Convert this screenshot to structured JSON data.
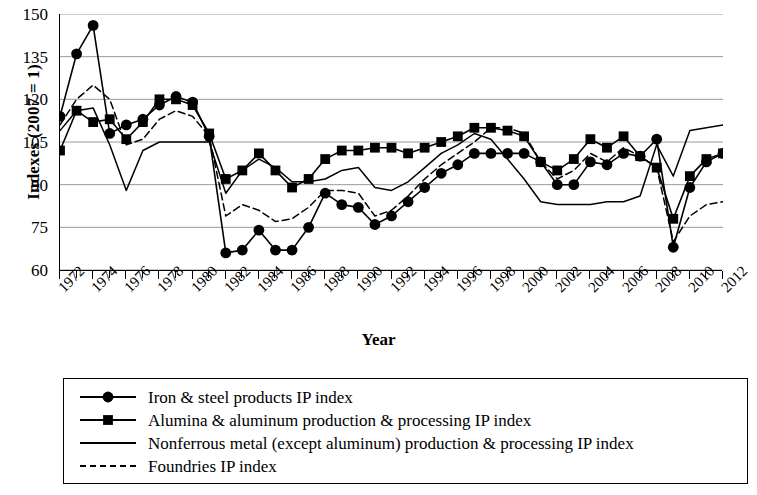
{
  "chart_data": {
    "type": "line",
    "title": "",
    "xlabel": "Year",
    "ylabel": "Indexes (2007 = 1)",
    "xlim": [
      1972,
      2012
    ],
    "ylim": [
      60,
      150
    ],
    "yticks": [
      150,
      135,
      120,
      105,
      90,
      75,
      60
    ],
    "xticks": [
      1972,
      1974,
      1976,
      1978,
      1980,
      1982,
      1984,
      1986,
      1988,
      1990,
      1992,
      1994,
      1996,
      1998,
      2000,
      2002,
      2004,
      2006,
      2008,
      2010,
      2012
    ],
    "xtick_labels": [
      "1972",
      "1974",
      "1976",
      "1978",
      "1980",
      "1982",
      "1984",
      "1986",
      "1988",
      "1990",
      "1992",
      "1994",
      "1996",
      "1998",
      "2000",
      "2002",
      "2004",
      "2006",
      "2008",
      "2010",
      "2012"
    ],
    "grid": "horizontal",
    "legend_position": "below",
    "x": [
      1972,
      1973,
      1974,
      1975,
      1976,
      1977,
      1978,
      1979,
      1980,
      1981,
      1982,
      1983,
      1984,
      1985,
      1986,
      1987,
      1988,
      1989,
      1990,
      1991,
      1992,
      1993,
      1994,
      1995,
      1996,
      1997,
      1998,
      1999,
      2000,
      2001,
      2002,
      2003,
      2004,
      2005,
      2006,
      2007,
      2008,
      2009,
      2010,
      2011,
      2012
    ],
    "series": [
      {
        "name": "Iron & steel products IP index",
        "marker": "circle",
        "line": "solid",
        "values": [
          114,
          136,
          146,
          108,
          111,
          113,
          118,
          121,
          119,
          107,
          66,
          67,
          74,
          67,
          67,
          75,
          87,
          83,
          82,
          76,
          79,
          84,
          89,
          94,
          97,
          101,
          101,
          101,
          101,
          98,
          90,
          90,
          98,
          97,
          101,
          100,
          106,
          68,
          89,
          98,
          101
        ]
      },
      {
        "name": "Alumina & aluminum production & processing IP index",
        "marker": "square",
        "line": "solid",
        "values": [
          102,
          116,
          112,
          113,
          106,
          112,
          120,
          120,
          118,
          108,
          92,
          95,
          101,
          95,
          89,
          92,
          99,
          102,
          102,
          103,
          103,
          101,
          103,
          105,
          107,
          110,
          110,
          109,
          107,
          98,
          95,
          99,
          106,
          103,
          107,
          100,
          96,
          78,
          93,
          99,
          101
        ]
      },
      {
        "name": "Nonferrous metal (except aluminum) production & processing IP index",
        "marker": "none",
        "line": "solid",
        "values": [
          109,
          116,
          117,
          104,
          88,
          102,
          105,
          105,
          105,
          105,
          87,
          95,
          99,
          96,
          91,
          91,
          92,
          95,
          96,
          89,
          88,
          91,
          96,
          101,
          104,
          108,
          106,
          99,
          92,
          84,
          83,
          83,
          83,
          84,
          84,
          86,
          104,
          93,
          109,
          110,
          111
        ]
      },
      {
        "name": "Foundries IP index",
        "marker": "none",
        "line": "dashed",
        "values": [
          111,
          120,
          125,
          120,
          104,
          106,
          113,
          116,
          114,
          107,
          79,
          83,
          81,
          77,
          78,
          82,
          88,
          88,
          87,
          79,
          81,
          86,
          92,
          97,
          101,
          105,
          110,
          110,
          108,
          98,
          92,
          95,
          101,
          98,
          103,
          100,
          96,
          70,
          79,
          83,
          84
        ]
      }
    ]
  },
  "axes": {
    "ylabel": "Indexes (2007 = 1)",
    "xlabel": "Year"
  },
  "legend": {
    "entries": [
      {
        "label": "Iron & steel products IP index",
        "key": "solid-line-circle-marker"
      },
      {
        "label": "Alumina & aluminum production & processing IP index",
        "key": "solid-line-square-marker"
      },
      {
        "label": "Nonferrous metal (except aluminum) production & processing IP index",
        "key": "solid-line"
      },
      {
        "label": "Foundries IP index",
        "key": "dashed-line"
      }
    ]
  },
  "colors": {
    "line": "#000000",
    "grid": "#9a9a9a",
    "axis": "#000000",
    "background": "#ffffff"
  }
}
